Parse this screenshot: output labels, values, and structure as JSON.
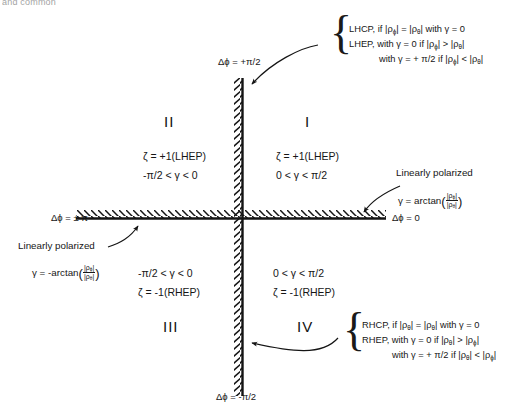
{
  "figure": {
    "type": "quadrant-diagram",
    "title_fragment": "and common"
  },
  "axes": {
    "vertical": {
      "top_label": "Δϕ = +π/2",
      "bottom_label": "Δϕ = -π/2",
      "style": "hatched"
    },
    "horizontal": {
      "left_label": "Δϕ = ± π",
      "right_label": "Δϕ = 0",
      "style": "hatched"
    }
  },
  "quadrants": [
    {
      "id": "I",
      "numeral": "I",
      "zeta": "ζ = +1(LHEP)",
      "gamma": "0 < γ < π/2"
    },
    {
      "id": "II",
      "numeral": "II",
      "zeta": "ζ = +1(LHEP)",
      "gamma": "-π/2 < γ < 0"
    },
    {
      "id": "III",
      "numeral": "III",
      "zeta": "ζ = -1(RHEP)",
      "gamma": "-π/2 < γ < 0"
    },
    {
      "id": "IV",
      "numeral": "IV",
      "zeta": "ζ = -1(RHEP)",
      "gamma": "0 < γ < π/2"
    }
  ],
  "annotations": {
    "top_note": {
      "line1_a": "LHCP, if |ρ",
      "line1_sub1": "ϕ",
      "line1_b": "| = |ρ",
      "line1_sub2": "θ",
      "line1_c": "| with γ = 0",
      "line2_a": "LHEP, with γ = 0 if |ρ",
      "line2_sub1": "ϕ",
      "line2_b": "| > |ρ",
      "line2_sub2": "θ",
      "line2_c": "|",
      "line3_a": "with γ = + π/2 if |ρ",
      "line3_sub1": "ϕ",
      "line3_b": "| < |ρ",
      "line3_sub2": "θ",
      "line3_c": "|"
    },
    "bottom_note": {
      "line1_a": "RHCP, if |ρ",
      "line1_sub1": "θ",
      "line1_b": "| = |ρ",
      "line1_sub2": "θ",
      "line1_c": "| with γ = 0",
      "line2_a": "RHEP, with γ = 0 if |ρ",
      "line2_sub1": "θ",
      "line2_b": "| > |ρ",
      "line2_sub2": "ϕ",
      "line2_c": "|",
      "line3_a": "with γ = + π/2 if |ρ",
      "line3_sub1": "θ",
      "line3_b": "| < |ρ",
      "line3_sub2": "ϕ",
      "line3_c": "|"
    },
    "right_linear": {
      "title": "Linearly polarized",
      "formula_prefix": "γ = arctan",
      "numerator_a": "|ρ",
      "numerator_sub": "ϕ",
      "numerator_b": "|",
      "denominator_a": "|ρ",
      "denominator_sub": "θ",
      "denominator_b": "|"
    },
    "left_linear": {
      "title": "Linearly polarized",
      "formula_prefix": "γ = -arctan",
      "numerator_a": "|ρ",
      "numerator_sub": "ϕ",
      "numerator_b": "|",
      "denominator_a": "|ρ",
      "denominator_sub": "θ",
      "denominator_b": "|"
    }
  },
  "colors": {
    "ink": "#1a1a1a",
    "background": "#ffffff",
    "axis": "#111111"
  }
}
